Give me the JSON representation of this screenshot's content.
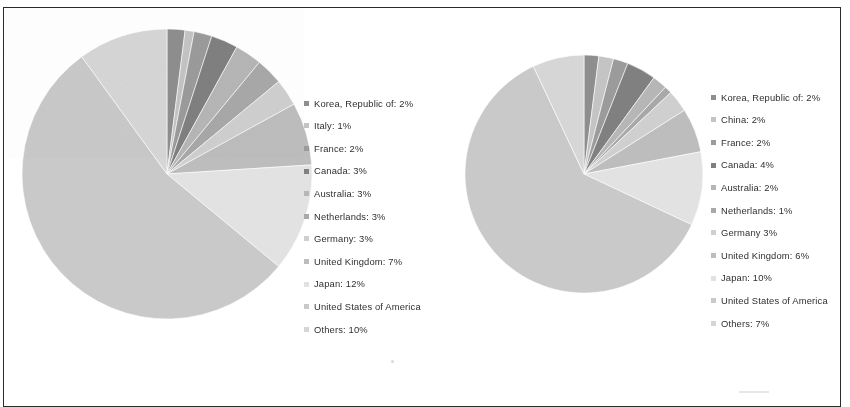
{
  "figure": {
    "border_color": "#2b2b2b",
    "background_color": "#ffffff"
  },
  "chart_data": [
    {
      "type": "pie",
      "title": "",
      "id": "left-pie",
      "legend_position": "right",
      "start_angle": 0,
      "direction": "clockwise",
      "labels": [
        "Korea, Republic of",
        "Italy",
        "France",
        "Canada",
        "Australia",
        "Netherlands",
        "Germany",
        "United Kingdom",
        "Japan",
        "United States of America",
        "Others"
      ],
      "values": [
        2,
        1,
        2,
        3,
        3,
        3,
        3,
        7,
        12,
        54,
        10
      ],
      "value_unit": "%",
      "legend_entries": [
        "Korea, Republic of: 2%",
        "Italy: 1%",
        "France: 2%",
        "Canada: 3%",
        "Australia: 3%",
        "Netherlands: 3%",
        "Germany: 3%",
        "United Kingdom: 7%",
        "Japan: 12%",
        "United States of America",
        "Others: 10%"
      ],
      "colors": [
        "#8e8e8e",
        "#c4c4c4",
        "#9b9b9b",
        "#808080",
        "#b6b6b6",
        "#a8a8a8",
        "#cfcfcf",
        "#bdbdbd",
        "#e2e2e2",
        "#c9c9c9",
        "#d6d6d6"
      ]
    },
    {
      "type": "pie",
      "title": "",
      "id": "right-pie",
      "legend_position": "right",
      "start_angle": 0,
      "direction": "clockwise",
      "labels": [
        "Korea, Republic of",
        "China",
        "France",
        "Canada",
        "Australia",
        "Netherlands",
        "Germany",
        "United Kingdom",
        "Japan",
        "United States of America",
        "Others"
      ],
      "values": [
        2,
        2,
        2,
        4,
        2,
        1,
        3,
        6,
        10,
        61,
        7
      ],
      "value_unit": "%",
      "legend_entries": [
        "Korea, Republic of: 2%",
        "China: 2%",
        "France: 2%",
        "Canada: 4%",
        "Australia: 2%",
        "Netherlands: 1%",
        "Germany  3%",
        "United Kingdom: 6%",
        "Japan: 10%",
        "United States of America",
        "Others: 7%"
      ],
      "colors": [
        "#8e8e8e",
        "#c4c4c4",
        "#9b9b9b",
        "#808080",
        "#b6b6b6",
        "#a8a8a8",
        "#cfcfcf",
        "#bdbdbd",
        "#e2e2e2",
        "#c9c9c9",
        "#d6d6d6"
      ]
    }
  ]
}
